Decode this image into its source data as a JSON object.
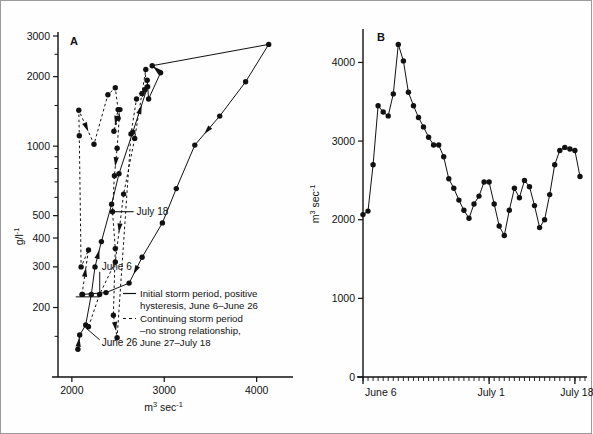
{
  "figure": {
    "border_color": "#9a9a9a",
    "background": "#ffffff",
    "ink_color": "#111111"
  },
  "chart_data": [
    {
      "type": "scatter",
      "panel_label": "A",
      "title": "",
      "xlabel": "m3 sec-1",
      "xlabel_base": "m",
      "xlabel_sup1": "3",
      "xlabel_mid": " sec",
      "xlabel_sup2": "-1",
      "ylabel": "g/l-1",
      "ylabel_base": "g/l",
      "ylabel_sup": "-1",
      "xscale": "linear",
      "yscale": "log",
      "xlim": [
        1850,
        4350
      ],
      "ylim": [
        100,
        3000
      ],
      "xticks": [
        2000,
        3000,
        4000
      ],
      "xtick_labels": [
        "2000",
        "3000",
        "4000"
      ],
      "yticks": [
        200,
        300,
        400,
        500,
        1000,
        2000,
        3000
      ],
      "ytick_labels": [
        "200",
        "300",
        "400",
        "500",
        "1000",
        "2000",
        "3000"
      ],
      "yminor": [
        150,
        600,
        700,
        800,
        900,
        1500,
        2500
      ],
      "grid": false,
      "series": [
        {
          "name": "Initial storm period, positive hysteresis, June 6-June 26",
          "style": "solid",
          "marker": "filled-circle",
          "points": [
            [
              2065,
              132
            ],
            [
              2085,
              152
            ],
            [
              2150,
              168
            ],
            [
              2210,
              228
            ],
            [
              2250,
              300
            ],
            [
              2320,
              386
            ],
            [
              2430,
              560
            ],
            [
              2510,
              760
            ],
            [
              2660,
              1150
            ],
            [
              2820,
              1810
            ],
            [
              2815,
              1930
            ],
            [
              2830,
              1600
            ],
            [
              2960,
              2080
            ],
            [
              2870,
              2230
            ],
            [
              4130,
              2760
            ],
            [
              3880,
              1900
            ],
            [
              3600,
              1350
            ],
            [
              3330,
              1010
            ],
            [
              3130,
              655
            ],
            [
              2980,
              465
            ],
            [
              2760,
              330
            ],
            [
              2620,
              255
            ],
            [
              2370,
              232
            ],
            [
              2115,
              228
            ]
          ]
        },
        {
          "name": "Continuing storm period -no strong relationship, June 27-July 18",
          "style": "dashed",
          "marker": "filled-circle",
          "points": [
            [
              2110,
              228
            ],
            [
              2180,
              355
            ],
            [
              2100,
              300
            ],
            [
              2080,
              1110
            ],
            [
              2075,
              1430
            ],
            [
              2240,
              1020
            ],
            [
              2390,
              1670
            ],
            [
              2470,
              1790
            ],
            [
              2500,
              1440
            ],
            [
              2455,
              1160
            ],
            [
              2500,
              1320
            ],
            [
              2520,
              1440
            ],
            [
              2490,
              980
            ],
            [
              2460,
              745
            ],
            [
              2440,
              520
            ],
            [
              2470,
              360
            ],
            [
              2450,
              185
            ],
            [
              2490,
              148
            ],
            [
              2640,
              1130
            ],
            [
              2700,
              1600
            ],
            [
              2760,
              1690
            ],
            [
              2790,
              1755
            ],
            [
              2800,
              2150
            ],
            [
              2680,
              1080
            ],
            [
              2560,
              620
            ],
            [
              2470,
              315
            ],
            [
              2300,
              228
            ],
            [
              2180,
              165
            ]
          ]
        }
      ],
      "annotations": [
        {
          "text": "July 18",
          "x": 2430,
          "y": 520
        },
        {
          "text": "June 6",
          "x": 2280,
          "y": 300
        },
        {
          "text": "June 26",
          "x": 2280,
          "y": 142
        }
      ],
      "legend": {
        "position": "inside-lower-right",
        "entries": [
          {
            "style": "solid",
            "line1": "Initial storm period, positive",
            "line2": "hysteresis, June 6–June 26"
          },
          {
            "style": "dashed",
            "line1": "Continuing storm period",
            "line2": "–no strong relationship,",
            "line3": "June 27–July 18"
          }
        ]
      }
    },
    {
      "type": "line",
      "panel_label": "B",
      "title": "",
      "xlabel": "",
      "ylabel": "m3 sec-1",
      "ylabel_base": "m",
      "ylabel_sup1": "3",
      "ylabel_mid": " sec",
      "ylabel_sup2": "-1",
      "xscale": "time",
      "yscale": "linear",
      "ylim": [
        0,
        4400
      ],
      "yticks": [
        0,
        1000,
        2000,
        3000,
        4000
      ],
      "ytick_labels": [
        "0",
        "1000",
        "2000",
        "3000",
        "4000"
      ],
      "xtick_labels": [
        "June 6",
        "July 1",
        "July 18"
      ],
      "xtick_positions": [
        0,
        25,
        42
      ],
      "xlim": [
        0,
        44
      ],
      "minor_tick_count": 44,
      "grid": false,
      "marker": "filled-circle",
      "x": [
        0,
        1,
        2,
        3,
        4,
        5,
        6,
        7,
        8,
        9,
        10,
        11,
        12,
        13,
        14,
        15,
        16,
        17,
        18,
        19,
        20,
        21,
        22,
        23,
        24,
        25,
        26,
        27,
        28,
        29,
        30,
        31,
        32,
        33,
        34,
        35,
        36,
        37,
        38,
        39,
        40,
        41,
        42,
        43
      ],
      "values": [
        2065,
        2110,
        2700,
        3450,
        3370,
        3320,
        3600,
        4230,
        4020,
        3620,
        3450,
        3300,
        3180,
        3050,
        2950,
        2950,
        2800,
        2520,
        2400,
        2250,
        2120,
        2020,
        2200,
        2300,
        2480,
        2480,
        2200,
        1920,
        1800,
        2120,
        2400,
        2280,
        2500,
        2420,
        2180,
        1900,
        2000,
        2320,
        2700,
        2880,
        2920,
        2900,
        2880,
        2550
      ]
    }
  ]
}
